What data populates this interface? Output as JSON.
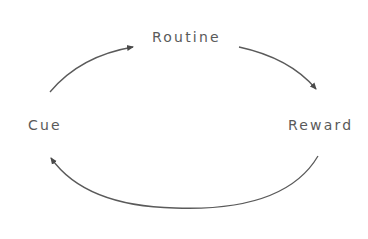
{
  "diagram": {
    "type": "habit-loop-cycle",
    "nodes": {
      "cue": "Cue",
      "routine": "Routine",
      "reward": "Reward"
    },
    "edges": [
      {
        "from": "Cue",
        "to": "Routine"
      },
      {
        "from": "Routine",
        "to": "Reward"
      },
      {
        "from": "Reward",
        "to": "Cue"
      }
    ],
    "colors": {
      "text": "#5a5a5a",
      "arrow": "#555555",
      "background": "#ffffff"
    }
  }
}
